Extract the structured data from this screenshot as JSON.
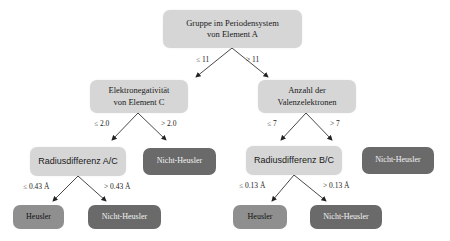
{
  "diagram": {
    "type": "decision-tree",
    "colors": {
      "question_node": "#d6d6d6",
      "leaf_heusler": "#8f8f8f",
      "leaf_nicht_heusler": "#6a6a6a",
      "edge": "#333333"
    },
    "root": {
      "label_line1": "Gruppe im Periodensystem",
      "label_line2": "von Element A",
      "edge_left": "≤ 11",
      "edge_right": "> 11"
    },
    "left_branch": {
      "label_line1": "Elektronegativität",
      "label_line2": "von Element C",
      "edge_left": "≤ 2.0",
      "edge_right": "> 2.0",
      "left_child": {
        "label": "Radiusdifferenz A/C",
        "edge_left": "≤ 0.43 Å",
        "edge_right": "> 0.43 Å",
        "leaf_left": "Heusler",
        "leaf_right": "Nicht-Heusler"
      },
      "right_leaf": "Nicht-Heusler"
    },
    "right_branch": {
      "label_line1": "Anzahl der",
      "label_line2": "Valenzelektronen",
      "edge_left": "≤ 7",
      "edge_right": "> 7",
      "left_child": {
        "label": "Radiusdifferenz B/C",
        "edge_left": "≤ 0.13 Å",
        "edge_right": "> 0.13 Å",
        "leaf_left": "Heusler",
        "leaf_right": "Nicht-Heusler"
      },
      "right_leaf": "Nicht-Heusler"
    }
  }
}
